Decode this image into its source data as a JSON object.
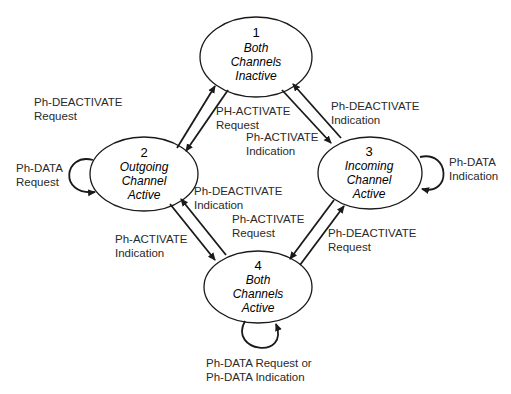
{
  "states": [
    {
      "id": "1",
      "number": "1",
      "lines": [
        "Both",
        "Channels",
        "Inactive"
      ],
      "cx": 256,
      "cy": 57,
      "rx": 56,
      "ry": 40
    },
    {
      "id": "2",
      "number": "2",
      "lines": [
        "Outgoing",
        "Channel",
        "Active"
      ],
      "cx": 144,
      "cy": 174,
      "rx": 54,
      "ry": 37
    },
    {
      "id": "3",
      "number": "3",
      "lines": [
        "Incoming",
        "Channel",
        "Active"
      ],
      "cx": 370,
      "cy": 173,
      "rx": 52,
      "ry": 36
    },
    {
      "id": "4",
      "number": "4",
      "lines": [
        "Both",
        "Channels",
        "Active"
      ],
      "cx": 258,
      "cy": 287,
      "rx": 54,
      "ry": 36
    }
  ],
  "transitions": [
    {
      "from": "2",
      "to": "1",
      "label": [
        "Ph-DEACTIVATE",
        "Request"
      ]
    },
    {
      "from": "1",
      "to": "2",
      "label": [
        "PH-ACTIVATE",
        "Request"
      ]
    },
    {
      "from": "1",
      "to": "3",
      "label": [
        "Ph-ACTIVATE",
        "Indication"
      ]
    },
    {
      "from": "3",
      "to": "1",
      "label": [
        "Ph-DEACTIVATE",
        "Indication"
      ]
    },
    {
      "from": "2",
      "to": "4",
      "label": [
        "Ph-ACTIVATE",
        "Indication"
      ]
    },
    {
      "from": "4",
      "to": "2",
      "label": [
        "Ph-DEACTIVATE",
        "Indication"
      ]
    },
    {
      "from": "3",
      "to": "4",
      "label": [
        "Ph-ACTIVATE",
        "Request"
      ]
    },
    {
      "from": "4",
      "to": "3",
      "label": [
        "Ph-DEACTIVATE",
        "Request"
      ]
    },
    {
      "from": "2",
      "to": "2",
      "label": [
        "Ph-DATA",
        "Request"
      ]
    },
    {
      "from": "3",
      "to": "3",
      "label": [
        "Ph-DATA",
        "Indication"
      ]
    },
    {
      "from": "4",
      "to": "4",
      "label": [
        "Ph-DATA Request or",
        "Ph-DATA Indication"
      ]
    }
  ],
  "colors": {
    "stroke": "#1a1a1a",
    "text": "#2a2a2a",
    "background": "#ffffff"
  }
}
